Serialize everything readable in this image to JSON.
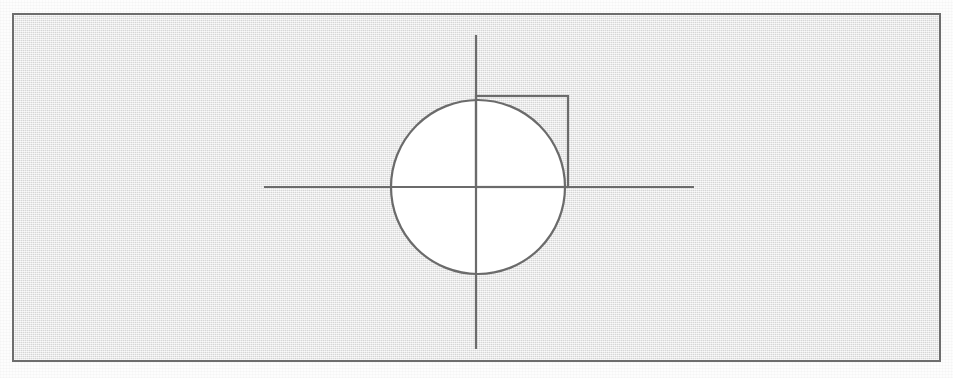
{
  "document": {
    "type": "geometry-figure",
    "title": "Circle with inscribed quadrant square",
    "background_color": "#e6e6e6",
    "ink_color": "#6b6b6b",
    "fill_color": "#ffffff",
    "frame": {
      "x": 12,
      "y": 13,
      "width": 929,
      "height": 349,
      "border_width": 2,
      "border_color": "#6d6d6d"
    }
  },
  "figure": {
    "origin": {
      "x": 462,
      "y": 172
    },
    "axes": {
      "horizontal": {
        "x1": 250,
        "y1": 172,
        "x2": 680,
        "y2": 172
      },
      "vertical": {
        "x1": 462,
        "y1": 20,
        "x2": 462,
        "y2": 334
      }
    },
    "circle": {
      "cx": 464,
      "cy": 172,
      "r": 87
    },
    "square": {
      "x": 462,
      "y": 81,
      "width": 92,
      "height": 91
    }
  },
  "labels": {
    "figure_description": "A circle centred on the origin of a pair of crossed axes, with a square drawn in the upper-right quadrant from the origin out to the circle."
  }
}
